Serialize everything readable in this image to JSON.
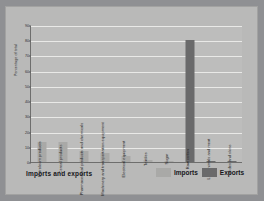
{
  "chart_data": {
    "type": "bar",
    "title": "Imports and exports",
    "xlabel": "",
    "ylabel": "Percentage of total",
    "ylim": [
      0,
      90
    ],
    "yticks": [
      0,
      10,
      20,
      30,
      40,
      50,
      60,
      70,
      80,
      90
    ],
    "grid": true,
    "legend_position": "bottom-right",
    "categories": [
      "Petroleum products",
      "Cereal products",
      "Pharmaceutical products and chemicals",
      "Machinery and transportation equipment",
      "Electrical equipment",
      "Textiles",
      "Sugar",
      "Raw cotton",
      "Live animals and meat",
      "Hides and skins"
    ],
    "series": [
      {
        "name": "Imports",
        "color": "#a9a9a7",
        "values": [
          13,
          13,
          7,
          6,
          4,
          1.5,
          0.8,
          0,
          0,
          0
        ]
      },
      {
        "name": "Exports",
        "color": "#6a6a6b",
        "values": [
          0,
          0,
          0,
          0,
          0,
          0,
          0,
          80,
          0.7,
          0.5
        ]
      }
    ]
  },
  "legend": {
    "imports_label": "Imports",
    "exports_label": "Exports"
  }
}
